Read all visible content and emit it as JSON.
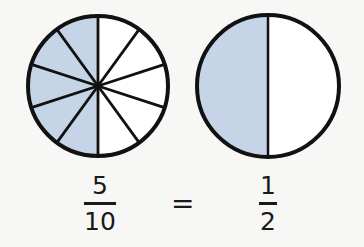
{
  "diagram": {
    "title": "",
    "colors": {
      "shade": "#c6d4e8",
      "stroke": "#111111",
      "background": "#f7f7f5",
      "unshaded": "#ffffff"
    },
    "circles": [
      {
        "id": "tenths",
        "cx": 98,
        "cy": 86,
        "r": 70,
        "sectors": 10,
        "shaded": 5,
        "shaded_side": "left"
      },
      {
        "id": "halves",
        "cx": 268,
        "cy": 86,
        "r": 71,
        "sectors": 2,
        "shaded": 1,
        "shaded_side": "left"
      }
    ],
    "equation": {
      "left": {
        "numerator": "5",
        "denominator": "10"
      },
      "operator": "=",
      "right": {
        "numerator": "1",
        "denominator": "2"
      }
    }
  }
}
